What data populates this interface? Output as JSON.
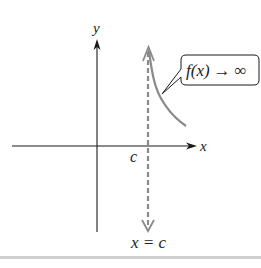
{
  "diagram": {
    "axes": {
      "x_label": "x",
      "y_label": "y"
    },
    "asymptote": {
      "tick_label": "c",
      "equation_label": "x = c",
      "style": "dashed",
      "color": "#8a8a8a"
    },
    "curve": {
      "color": "#8a8a8a",
      "behavior": "increasing toward +infinity as x approaches c from the right"
    },
    "callout": {
      "func": "f(x)",
      "arrow": "→",
      "limit": "∞"
    },
    "colors": {
      "axis": "#1a1a1a",
      "curve": "#8a8a8a",
      "band": "#cfcfcf"
    }
  }
}
